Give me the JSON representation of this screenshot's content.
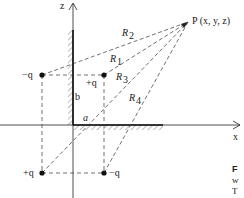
{
  "diagram": {
    "axes": {
      "z_label": "z",
      "x_label": "x"
    },
    "point": {
      "label": "P (x, y, z)"
    },
    "charges": [
      {
        "id": "top-left",
        "label": "−q"
      },
      {
        "id": "top-right",
        "label": "+q"
      },
      {
        "id": "bottom-left",
        "label": "+q"
      },
      {
        "id": "bottom-right",
        "label": "−q"
      }
    ],
    "distances": [
      {
        "id": "R1",
        "label": "R",
        "sub": "1"
      },
      {
        "id": "R2",
        "label": "R",
        "sub": "2"
      },
      {
        "id": "R3",
        "label": "R",
        "sub": "3"
      },
      {
        "id": "R4",
        "label": "R",
        "sub": "4"
      }
    ],
    "dimensions": {
      "a": "a",
      "b": "b"
    }
  },
  "caption": {
    "lines": [
      "F",
      "w",
      "T"
    ]
  }
}
